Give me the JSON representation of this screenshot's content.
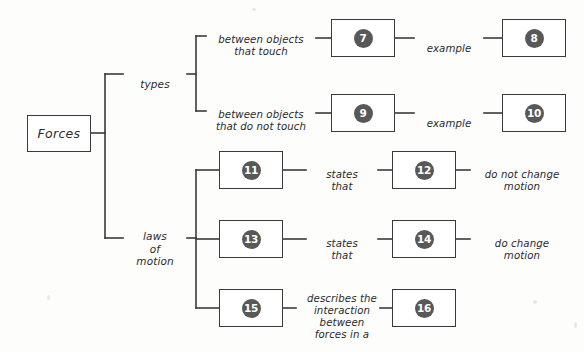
{
  "diagram": {
    "root": {
      "label": "Forces",
      "x": 27,
      "y": 115,
      "w": 64,
      "h": 37
    },
    "branch_labels": [
      {
        "id": "types",
        "text": "types",
        "x": 123,
        "y": 66,
        "w": 64,
        "h": 16
      },
      {
        "id": "laws",
        "text": "laws\nof\nmotion",
        "x": 123,
        "y": 218,
        "w": 64,
        "h": 42
      }
    ],
    "link_labels": [
      {
        "id": "touch",
        "text": "between objects\nthat touch",
        "x": 199,
        "y": 22,
        "w": 124,
        "h": 28
      },
      {
        "id": "no-touch",
        "text": "between objects\nthat do not touch",
        "x": 199,
        "y": 97,
        "w": 124,
        "h": 28
      },
      {
        "id": "example-1",
        "text": "example",
        "x": 409,
        "y": 31,
        "w": 80,
        "h": 14
      },
      {
        "id": "example-2",
        "text": "example",
        "x": 409,
        "y": 106,
        "w": 80,
        "h": 14
      },
      {
        "id": "states-1",
        "text": "states\nthat",
        "x": 306,
        "y": 157,
        "w": 72,
        "h": 28
      },
      {
        "id": "states-2",
        "text": "states\nthat",
        "x": 306,
        "y": 226,
        "w": 72,
        "h": 28
      },
      {
        "id": "describes",
        "text": "describes the\ninteraction\nbetween\nforces in a",
        "x": 294,
        "y": 281,
        "w": 96,
        "h": 56
      },
      {
        "id": "no-change",
        "text": "do not change\nmotion",
        "x": 470,
        "y": 157,
        "w": 104,
        "h": 28
      },
      {
        "id": "do-change",
        "text": "do change\nmotion",
        "x": 470,
        "y": 226,
        "w": 104,
        "h": 28
      }
    ],
    "numbered_boxes": [
      {
        "id": "box-7",
        "number": "7",
        "x": 331,
        "y": 19,
        "w": 64,
        "h": 38
      },
      {
        "id": "box-8",
        "number": "8",
        "x": 502,
        "y": 19,
        "w": 64,
        "h": 38
      },
      {
        "id": "box-9",
        "number": "9",
        "x": 331,
        "y": 94,
        "w": 64,
        "h": 38
      },
      {
        "id": "box-10",
        "number": "10",
        "x": 502,
        "y": 94,
        "w": 64,
        "h": 38
      },
      {
        "id": "box-11",
        "number": "11",
        "x": 219,
        "y": 151,
        "w": 64,
        "h": 38
      },
      {
        "id": "box-12",
        "number": "12",
        "x": 392,
        "y": 151,
        "w": 64,
        "h": 38
      },
      {
        "id": "box-13",
        "number": "13",
        "x": 219,
        "y": 220,
        "w": 64,
        "h": 38
      },
      {
        "id": "box-14",
        "number": "14",
        "x": 392,
        "y": 220,
        "w": 64,
        "h": 38
      },
      {
        "id": "box-15",
        "number": "15",
        "x": 219,
        "y": 289,
        "w": 64,
        "h": 38
      },
      {
        "id": "box-16",
        "number": "16",
        "x": 392,
        "y": 289,
        "w": 64,
        "h": 38
      }
    ],
    "colors": {
      "line": "#3a3a3a",
      "badge_fill": "#585858",
      "badge_text": "#ffffff",
      "text": "#2b2b2b",
      "background": "#fdfdfc"
    }
  }
}
